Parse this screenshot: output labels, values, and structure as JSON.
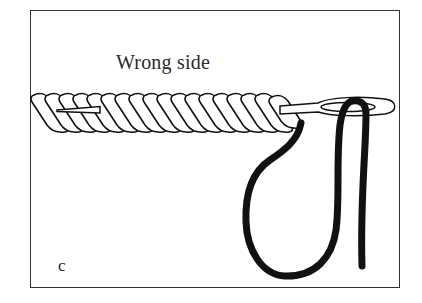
{
  "figure": {
    "caption": "Wrong side",
    "panel_label": "c",
    "colors": {
      "ink": "#111111",
      "frame": "#333333",
      "background": "#ffffff"
    },
    "elements": {
      "cord": "twisted-cord",
      "needle": "tapestry-needle",
      "thread": "thread-loop"
    }
  }
}
